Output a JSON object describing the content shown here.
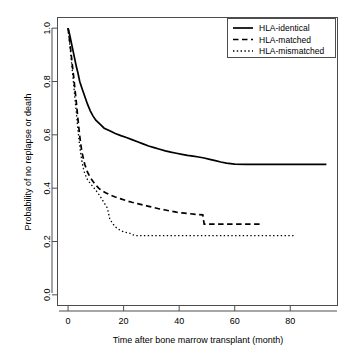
{
  "chart_data": {
    "type": "line",
    "title": "",
    "xlabel": "Time after bone marrow transplant (month)",
    "ylabel": "Probability of no replapse or death",
    "xlim": [
      -3.8,
      97
    ],
    "ylim": [
      -0.04,
      1.04
    ],
    "xticks": [
      0,
      20,
      40,
      60,
      80
    ],
    "xtick_labels": [
      "0",
      "20",
      "40",
      "60",
      "80"
    ],
    "yticks": [
      0.0,
      0.2,
      0.4,
      0.6,
      0.8,
      1.0
    ],
    "ytick_labels": [
      "0.0",
      "0.2",
      "0.4",
      "0.6",
      "0.8",
      "1.0"
    ],
    "grid": false,
    "legend_position": "top-right",
    "series": [
      {
        "name": "HLA-identical",
        "style": "solid",
        "color": "#000000",
        "x": [
          0,
          0.6,
          1.2,
          1.8,
          2.4,
          3.0,
          3.6,
          4.2,
          5.0,
          6.0,
          7.0,
          8.0,
          9.0,
          10.0,
          11.5,
          13.0,
          15.0,
          17.0,
          19.0,
          21.0,
          23.0,
          25.0,
          27.0,
          29.0,
          31.0,
          33.0,
          35.0,
          37.0,
          39.0,
          41.0,
          43.0,
          45.0,
          47.0,
          49.0,
          51.0,
          53.0,
          55.0,
          57.0,
          60.0,
          64.0,
          70.0,
          78.0,
          86.0,
          93.0
        ],
        "y": [
          1.0,
          0.975,
          0.945,
          0.915,
          0.885,
          0.855,
          0.83,
          0.8,
          0.775,
          0.745,
          0.715,
          0.69,
          0.67,
          0.655,
          0.64,
          0.625,
          0.615,
          0.605,
          0.597,
          0.59,
          0.582,
          0.574,
          0.566,
          0.558,
          0.552,
          0.546,
          0.54,
          0.535,
          0.531,
          0.527,
          0.523,
          0.52,
          0.517,
          0.513,
          0.508,
          0.503,
          0.498,
          0.494,
          0.49,
          0.489,
          0.489,
          0.489,
          0.489,
          0.489
        ]
      },
      {
        "name": "HLA-matched",
        "style": "dashed",
        "color": "#000000",
        "x": [
          0,
          0.5,
          1.0,
          1.5,
          2.0,
          2.5,
          3.0,
          3.5,
          4.0,
          4.5,
          5.0,
          6.0,
          7.0,
          8.0,
          9.0,
          10.0,
          11.0,
          12.0,
          13.5,
          15.0,
          17.0,
          19.0,
          21.0,
          23.0,
          25.0,
          27.0,
          29.0,
          31.0,
          33.0,
          35.0,
          37.0,
          39.0,
          41.0,
          44.0,
          47.0,
          48.5,
          49.0,
          52.0,
          58.0,
          64.0,
          69.0,
          70.0
        ],
        "y": [
          1.0,
          0.96,
          0.915,
          0.865,
          0.82,
          0.77,
          0.72,
          0.665,
          0.615,
          0.57,
          0.535,
          0.49,
          0.46,
          0.44,
          0.425,
          0.412,
          0.4,
          0.392,
          0.383,
          0.375,
          0.367,
          0.36,
          0.353,
          0.347,
          0.342,
          0.337,
          0.332,
          0.327,
          0.322,
          0.318,
          0.314,
          0.31,
          0.307,
          0.304,
          0.301,
          0.3,
          0.265,
          0.265,
          0.265,
          0.265,
          0.265,
          0.265
        ]
      },
      {
        "name": "HLA-mismatched",
        "style": "dotted",
        "color": "#000000",
        "x": [
          0,
          0.5,
          1.0,
          1.5,
          2.0,
          2.5,
          3.0,
          3.5,
          4.0,
          4.5,
          5.0,
          5.5,
          6.0,
          7.0,
          8.0,
          9.0,
          10.0,
          11.0,
          12.0,
          13.0,
          14.0,
          14.5,
          15.0,
          16.0,
          17.0,
          18.0,
          19.0,
          20.0,
          22.0,
          24.0,
          28.0,
          34.0,
          42.0,
          52.0,
          62.0,
          72.0,
          80.0,
          82.0
        ],
        "y": [
          1.0,
          0.95,
          0.9,
          0.845,
          0.79,
          0.735,
          0.68,
          0.625,
          0.575,
          0.535,
          0.5,
          0.475,
          0.455,
          0.432,
          0.418,
          0.405,
          0.392,
          0.378,
          0.362,
          0.345,
          0.328,
          0.31,
          0.285,
          0.268,
          0.255,
          0.247,
          0.241,
          0.236,
          0.232,
          0.222,
          0.222,
          0.222,
          0.222,
          0.222,
          0.222,
          0.222,
          0.222,
          0.222
        ]
      }
    ]
  },
  "legend": {
    "items": [
      {
        "label": "HLA-identical",
        "style": "solid"
      },
      {
        "label": "HLA-matched",
        "style": "dashed"
      },
      {
        "label": "HLA-mismatched",
        "style": "dotted"
      }
    ]
  }
}
